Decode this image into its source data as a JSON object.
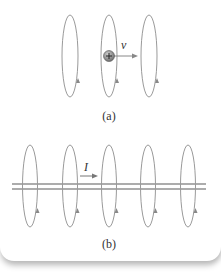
{
  "figure": {
    "part_a": {
      "caption": "(a)",
      "velocity_label": "v",
      "charge_symbol": "+",
      "loop_count": 3,
      "colors": {
        "loop": "#999999",
        "charge": "#8a8a8a",
        "arrow": "#888888"
      }
    },
    "part_b": {
      "caption": "(b)",
      "current_label": "I",
      "loop_count": 5,
      "colors": {
        "loop": "#999999",
        "wire": "#555555",
        "arrow": "#777777"
      }
    }
  }
}
